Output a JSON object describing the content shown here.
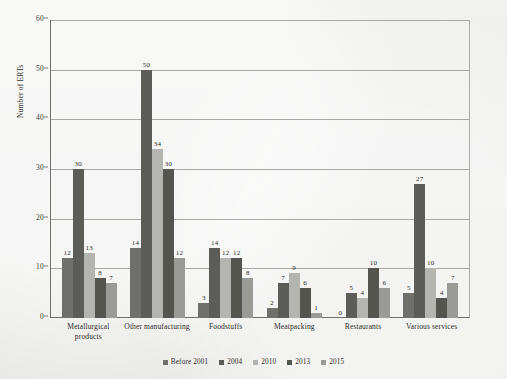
{
  "chart_data": {
    "type": "bar",
    "title": "",
    "xlabel": "",
    "ylabel": "Number of ERTs",
    "ylim": [
      0,
      60
    ],
    "yticks": [
      0,
      10,
      20,
      30,
      40,
      50,
      60
    ],
    "grid": true,
    "legend_position": "bottom",
    "categories": [
      "Metallurgical products",
      "Other manufacturing",
      "Foodstuffs",
      "Meatpacking",
      "Restaurants",
      "Various services"
    ],
    "category_lines": [
      [
        "Metallurgical",
        "products"
      ],
      [
        "Other manufacturing"
      ],
      [
        "Foodstuffs"
      ],
      [
        "Meatpacking"
      ],
      [
        "Restaurants"
      ],
      [
        "Various services"
      ]
    ],
    "series": [
      {
        "name": "Before 2001",
        "color": "#6f6f6b",
        "values": [
          12,
          14,
          3,
          2,
          0,
          5
        ]
      },
      {
        "name": "2004",
        "color": "#5c5c58",
        "values": [
          30,
          50,
          14,
          7,
          5,
          27
        ]
      },
      {
        "name": "2010",
        "color": "#b4b4b0",
        "values": [
          13,
          34,
          12,
          9,
          4,
          10
        ]
      },
      {
        "name": "2013",
        "color": "#55554f",
        "values": [
          8,
          30,
          12,
          6,
          10,
          4
        ]
      },
      {
        "name": "2015",
        "color": "#9a9a96",
        "values": [
          7,
          12,
          8,
          1,
          6,
          7
        ]
      }
    ]
  }
}
